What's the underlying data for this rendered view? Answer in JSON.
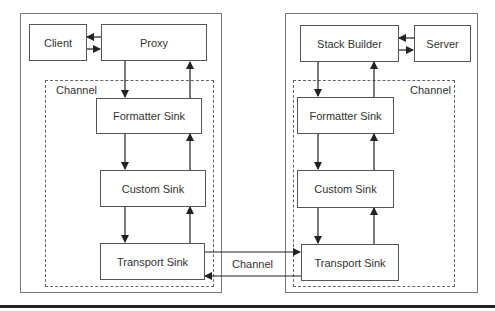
{
  "diagram": {
    "left_side": {
      "nodes": {
        "client": "Client",
        "proxy": "Proxy",
        "formatter": "Formatter Sink",
        "custom": "Custom Sink",
        "transport": "Transport Sink"
      },
      "channel_label": "Channel"
    },
    "right_side": {
      "nodes": {
        "stack_builder": "Stack Builder",
        "server": "Server",
        "formatter": "Formatter Sink",
        "custom": "Custom Sink",
        "transport": "Transport Sink"
      },
      "channel_label": "Channel"
    },
    "link_label": "Channel",
    "edges": [
      [
        "Proxy",
        "Client"
      ],
      [
        "Client",
        "Proxy"
      ],
      [
        "Proxy",
        "Formatter Sink (L)"
      ],
      [
        "Formatter Sink (L)",
        "Proxy"
      ],
      [
        "Formatter Sink (L)",
        "Custom Sink (L)"
      ],
      [
        "Custom Sink (L)",
        "Formatter Sink (L)"
      ],
      [
        "Custom Sink (L)",
        "Transport Sink (L)"
      ],
      [
        "Transport Sink (L)",
        "Custom Sink (L)"
      ],
      [
        "Transport Sink (L)",
        "Transport Sink (R)"
      ],
      [
        "Transport Sink (R)",
        "Transport Sink (L)"
      ],
      [
        "Server",
        "Stack Builder"
      ],
      [
        "Stack Builder",
        "Server"
      ],
      [
        "Stack Builder",
        "Formatter Sink (R)"
      ],
      [
        "Formatter Sink (R)",
        "Stack Builder"
      ],
      [
        "Formatter Sink (R)",
        "Custom Sink (R)"
      ],
      [
        "Custom Sink (R)",
        "Formatter Sink (R)"
      ],
      [
        "Custom Sink (R)",
        "Transport Sink (R)"
      ],
      [
        "Transport Sink (R)",
        "Custom Sink (R)"
      ]
    ]
  }
}
